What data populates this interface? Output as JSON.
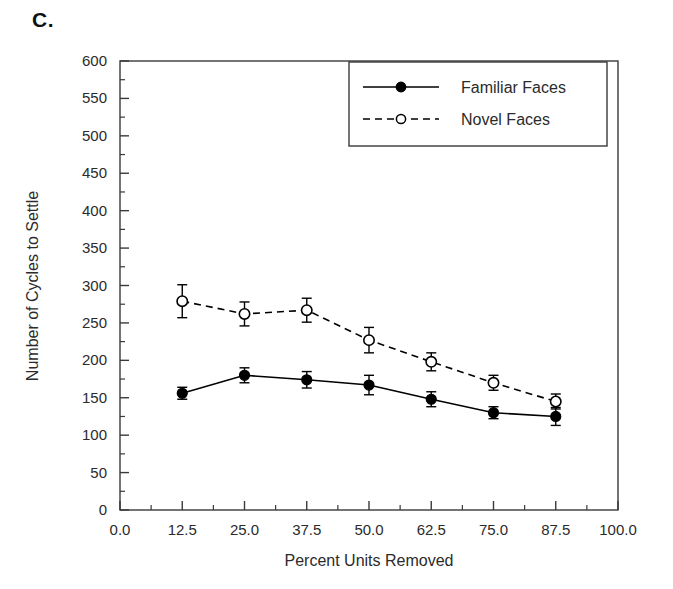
{
  "figure": {
    "panel_label": "C.",
    "background_color": "#ffffff",
    "ink_color": "#1a1a1a"
  },
  "chart_data": {
    "type": "line",
    "title": "",
    "panel": "C.",
    "xlabel": "Percent Units Removed",
    "ylabel": "Number of Cycles to Settle",
    "x": [
      12.5,
      25.0,
      37.5,
      50.0,
      62.5,
      75.0,
      87.5
    ],
    "xlim": [
      0.0,
      100.0
    ],
    "ylim": [
      0,
      600
    ],
    "xticks": [
      0.0,
      12.5,
      25.0,
      37.5,
      50.0,
      62.5,
      75.0,
      87.5,
      100.0
    ],
    "xticklabels": [
      "0.0",
      "12.5",
      "25.0",
      "37.5",
      "50.0",
      "62.5",
      "75.0",
      "87.5",
      "100.0"
    ],
    "yticks": [
      0,
      50,
      100,
      150,
      200,
      250,
      300,
      350,
      400,
      450,
      500,
      550,
      600
    ],
    "yticklabels": [
      "0",
      "50",
      "100",
      "150",
      "200",
      "250",
      "300",
      "350",
      "400",
      "450",
      "500",
      "550",
      "600"
    ],
    "minor_ticks": true,
    "grid": false,
    "legend_position": "upper right",
    "error_bars": "symmetric",
    "series": [
      {
        "name": "Familiar Faces",
        "marker": "filled-circle",
        "linestyle": "solid",
        "color": "#000000",
        "values": [
          156,
          180,
          174,
          167,
          148,
          130,
          125
        ],
        "errors": [
          8,
          10,
          11,
          13,
          10,
          8,
          12
        ]
      },
      {
        "name": "Novel Faces",
        "marker": "open-circle",
        "linestyle": "dashed",
        "color": "#000000",
        "values": [
          279,
          262,
          267,
          227,
          198,
          170,
          145
        ],
        "errors": [
          22,
          16,
          16,
          17,
          12,
          10,
          10
        ]
      }
    ]
  },
  "legend": {
    "entries": [
      {
        "label": "Familiar Faces",
        "marker": "filled-circle",
        "linestyle": "solid"
      },
      {
        "label": "Novel Faces",
        "marker": "open-circle",
        "linestyle": "dashed"
      }
    ]
  },
  "axes": {
    "x_title": "Percent Units Removed",
    "y_title": "Number of Cycles to Settle"
  }
}
